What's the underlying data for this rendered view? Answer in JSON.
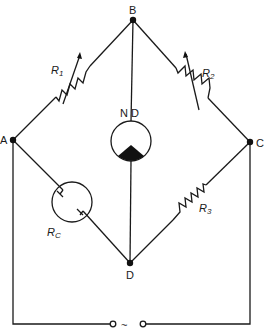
{
  "diagram": {
    "type": "Wheatstone bridge circuit",
    "nodes": {
      "A": {
        "label": "A"
      },
      "B": {
        "label": "B"
      },
      "C": {
        "label": "C"
      },
      "D": {
        "label": "D"
      }
    },
    "components": {
      "r1": {
        "label": "R",
        "subscript": "1",
        "kind": "variable resistor",
        "between": "A-B"
      },
      "r2": {
        "label": "R",
        "subscript": "2",
        "kind": "variable resistor",
        "between": "B-C"
      },
      "r3": {
        "label": "R",
        "subscript": "3",
        "kind": "resistor",
        "between": "C-D"
      },
      "rc": {
        "label": "R",
        "subscript": "C",
        "kind": "cell / conductivity cell",
        "between": "A-D"
      },
      "nd": {
        "label": "N D",
        "kind": "null detector",
        "between": "B-D"
      },
      "source": {
        "label": "~",
        "kind": "AC source",
        "between": "A-C"
      }
    },
    "colors": {
      "line": "#1a1a1a",
      "background": "#ffffff"
    }
  }
}
